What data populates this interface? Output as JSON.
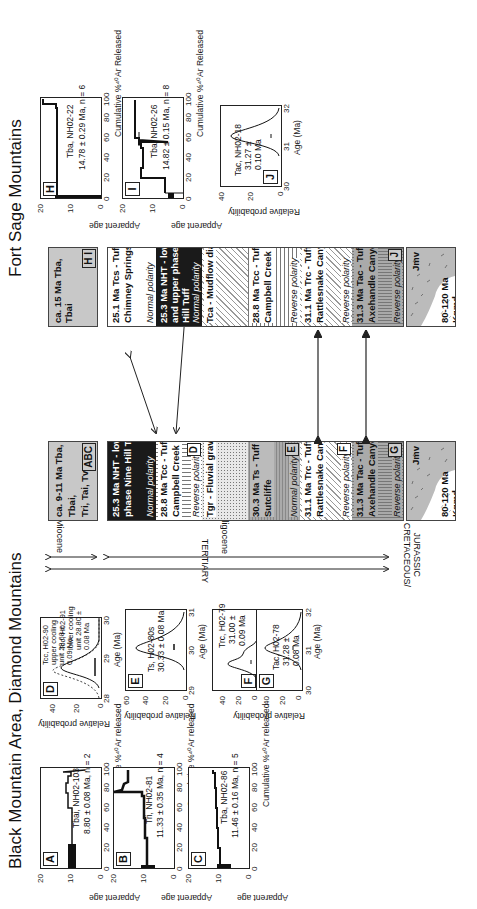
{
  "figure": {
    "titles": {
      "left": "Black Mountain Area, Diamond Mountains",
      "right": "Fort Sage Mountains"
    },
    "age_spectra": [
      {
        "id": "A",
        "sample": "Tbai, NH02-103",
        "age": "8.80 ± 0.08 Ma, n = 2",
        "ylabel": "Apparent age",
        "xlabel": "Cumulative %⁴⁰Ar released",
        "yticks": [
          "20",
          "10",
          "0"
        ],
        "xticks": [
          "0",
          "20",
          "40",
          "60",
          "80",
          "100"
        ]
      },
      {
        "id": "B",
        "sample": "Tri, NH02-81",
        "age": "11.33 ± 0.35 Ma, n = 4",
        "ylabel": "Apparent age",
        "xlabel": "Cumulative %⁴⁰Ar released",
        "yticks": [
          "20",
          "10",
          "0"
        ],
        "xticks": [
          "0",
          "20",
          "40",
          "60",
          "80",
          "100"
        ]
      },
      {
        "id": "C",
        "sample": "Tba, NH02-86",
        "age": "11.46 ± 0.16 Ma, n = 5",
        "ylabel": "Apparent age",
        "xlabel": "Cumulative %⁴⁰Ar released",
        "yticks": [
          "20",
          "10",
          "0"
        ],
        "xticks": [
          "0",
          "20",
          "40",
          "60",
          "80",
          "100"
        ]
      },
      {
        "id": "H",
        "sample": "Tba, NH02-22",
        "age": "14.78 ± 0.29 Ma, n = 6",
        "ylabel": "Apparent age",
        "xlabel": "Cumulative %⁴⁰Ar Released",
        "yticks": [
          "20",
          "10",
          "0"
        ],
        "xticks": [
          "0",
          "20",
          "40",
          "60",
          "80",
          "100"
        ]
      },
      {
        "id": "I",
        "sample": "Tba, NH02-26",
        "age": "14.82 ± 0.15 Ma, n = 8",
        "ylabel": "Apparent age",
        "xlabel": "Cumulative %⁴⁰Ar Released",
        "yticks": [
          "20",
          "10",
          "0"
        ],
        "xticks": [
          "0",
          "20",
          "40",
          "60",
          "80",
          "100"
        ]
      }
    ],
    "probability_plots": [
      {
        "id": "D",
        "ylabel": "Relative probability",
        "xlabel": "Age (Ma)",
        "yticks": [
          "40",
          "20",
          "0"
        ],
        "xticks": [
          "28",
          "29",
          "30"
        ],
        "annot1": [
          "Tcc, H02-90",
          "upper cooling",
          "unit 28.68 ±",
          "0.09 Ma"
        ],
        "annot2": [
          "Tcc, H02-91",
          "lower cooling",
          "unit 28.80 ±",
          "0.08 Ma"
        ]
      },
      {
        "id": "E",
        "ylabel": "Relative probability",
        "xlabel": "Age (Ma)",
        "yticks": [
          "60",
          "40",
          "20",
          "0"
        ],
        "xticks": [
          "29",
          "30",
          "31"
        ],
        "annot": [
          "Ts, H02-80s",
          "30.33 ± 0.08 Ma"
        ]
      },
      {
        "id": "F",
        "yticks": [
          "40",
          "20",
          "0"
        ],
        "annot": [
          "Trc, H02-79",
          "31.00 ±",
          "0.09 Ma"
        ]
      },
      {
        "id": "G",
        "ylabel": "Relative probability",
        "xlabel": "Age (Ma)",
        "yticks": [
          "40",
          "20",
          "0"
        ],
        "xticks": [
          "30",
          "31",
          "32"
        ],
        "annot": [
          "Tac, H02-78",
          "31.28 ±",
          "0.08 Ma"
        ]
      },
      {
        "id": "J",
        "sample": "Tac, NH02-18",
        "ylabel": "Relative probability",
        "xlabel": "Age (Ma)",
        "yticks": [
          "40",
          "20",
          "0"
        ],
        "xticks": [
          "30",
          "31",
          "32"
        ],
        "annot": [
          "Tac, NH02-18",
          "31.27 ±",
          "0.10 Ma"
        ]
      }
    ],
    "timescale": {
      "miocene": "Miocene",
      "oligocene": "Oligocene",
      "tertiary": "TERTIARY",
      "cretaceous": "CRETACEOUS/",
      "jurassic": "JURASSIC"
    },
    "black_mountain_column": {
      "top": {
        "text": [
          "ca. 9-11 Ma Tba, Tbai,",
          "Tri, Tai, Tvc"
        ],
        "tag": "ABC"
      },
      "units": [
        {
          "text": [
            "25.3 Ma NHT - lower",
            "phase Nine Hill Tuff"
          ],
          "polarity": "Normal polarity",
          "tag": ""
        },
        {
          "text": [
            "28.8 Ma Tcc - Tuff of",
            "Campbell Creek"
          ],
          "polarity": "Reverse polarity",
          "tag": "D"
        },
        {
          "text": [
            "Tgr - Fluvial gravels"
          ],
          "polarity": "",
          "tag": ""
        },
        {
          "text": [
            "30.3 Ma Ts - Tuff of",
            "Sutcliffe"
          ],
          "polarity": "Normal polarity",
          "tag": "E"
        },
        {
          "text": [
            "31.1 Ma Trc - Tuff of",
            "Rattlesnake Canyon"
          ],
          "polarity": "Reverse polarity",
          "tag": "F"
        },
        {
          "text": [
            "31.3 Ma Tac - Tuff of",
            "Axehandle Canyon"
          ],
          "polarity": "Reverse polarity",
          "tag": "G"
        }
      ],
      "basement": {
        "upper": "Jmv",
        "lower": [
          "80-120 Ma",
          "Kqmd"
        ]
      }
    },
    "fort_sage_column": {
      "top": {
        "text": [
          "ca. 15 Ma Tba, Tbai"
        ],
        "tag": "H I"
      },
      "units": [
        {
          "text": [
            "25.1 Ma Tcs - Tuff of",
            "Chimney Springs"
          ],
          "polarity": "Normal polarity",
          "tag": ""
        },
        {
          "text": [
            "25.3 Ma NHT - lower",
            "and upper phase Nine",
            "Hill Tuff"
          ],
          "polarity": "Normal polarity",
          "tag": ""
        },
        {
          "text": [
            "Tca - Mudflow diamict"
          ],
          "polarity": "",
          "tag": ""
        },
        {
          "text": [
            "28.8 Ma Tcc - Tuff of",
            "Campbell Creek"
          ],
          "polarity": "Reverse polarity",
          "tag": ""
        },
        {
          "text": [
            "31.1 Ma Trc - Tuff of",
            "Rattlesnake Canyon"
          ],
          "polarity": "Reverse polarity",
          "tag": ""
        },
        {
          "text": [
            "31.3 Ma Tac - Tuff of",
            "Axehandle Canyon"
          ],
          "polarity": "Reverse polarity",
          "tag": "J"
        }
      ],
      "basement": {
        "upper": "Jmv",
        "lower": [
          "80-120 Ma",
          "Kqmd"
        ]
      }
    }
  }
}
